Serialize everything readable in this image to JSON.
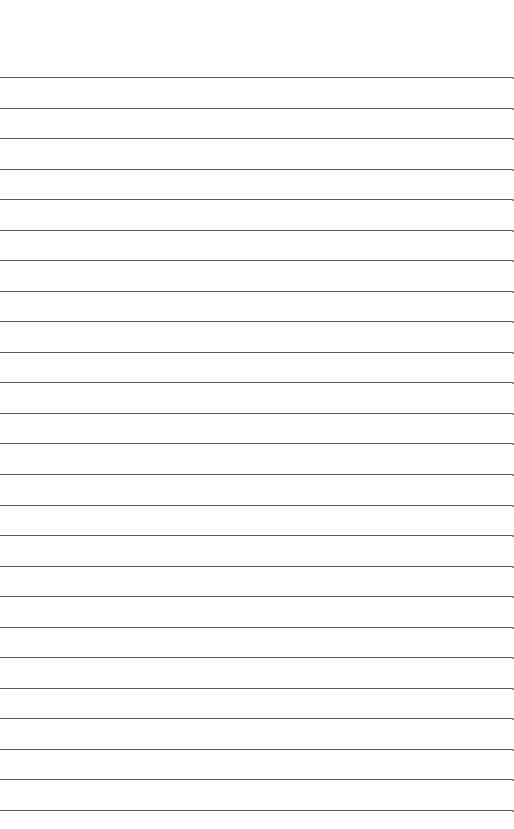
{
  "page": {
    "type": "ruled-paper",
    "background": "#ffffff",
    "line_color": "#5a5a5a",
    "first_line_y": 77,
    "line_spacing": 30.54,
    "line_count": 25,
    "text": ""
  }
}
